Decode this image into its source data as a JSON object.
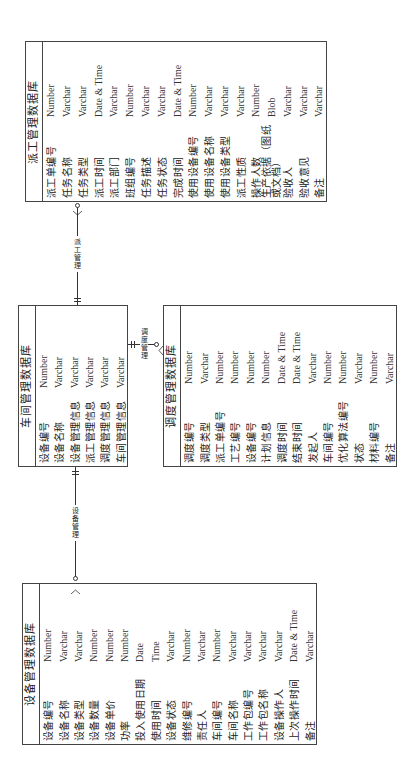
{
  "diagram": {
    "tables": {
      "dispatch": {
        "title": "派工管理数据库",
        "fields": [
          {
            "name": "派工单编号",
            "type": "Number"
          },
          {
            "name": "任务名称",
            "type": "Varchar"
          },
          {
            "name": "任务类型",
            "type": "Varchar"
          },
          {
            "name": "派工时间",
            "type": "Date & Time"
          },
          {
            "name": "派工部门",
            "type": "Varchar"
          },
          {
            "name": "班组编号",
            "type": "Number"
          },
          {
            "name": "任务描述",
            "type": "Varchar"
          },
          {
            "name": "任务状态",
            "type": "Varchar"
          },
          {
            "name": "完成时间",
            "type": "Date & Time"
          },
          {
            "name": "使用设备编号",
            "type": "Number"
          },
          {
            "name": "使用设备名称",
            "type": "Varchar"
          },
          {
            "name": "使用设备类型",
            "type": "Varchar"
          },
          {
            "name": "派工性质",
            "type": "Varchar"
          },
          {
            "name": "操作人数",
            "type": "Number"
          },
          {
            "name": "生产依据（图纸或文档）",
            "type": "Blob"
          },
          {
            "name": "验收人",
            "type": "Varchar"
          },
          {
            "name": "验收意见",
            "type": "Varchar"
          },
          {
            "name": "备注",
            "type": "Varchar"
          }
        ]
      },
      "workshop": {
        "title": "车间管理数据库",
        "fields": [
          {
            "name": "设备编号",
            "type": "Number"
          },
          {
            "name": "设备名称",
            "type": "Varchar"
          },
          {
            "name": "设备管理信息",
            "type": "Varchar"
          },
          {
            "name": "派工管理信息",
            "type": "Varchar"
          },
          {
            "name": "调度管理信息",
            "type": "Varchar"
          },
          {
            "name": "车间管理信息",
            "type": "Varchar"
          }
        ]
      },
      "scheduling": {
        "title": "调度管理数据库",
        "fields": [
          {
            "name": "调度编号",
            "type": "Number"
          },
          {
            "name": "调度类型",
            "type": "Varchar"
          },
          {
            "name": "派工单编号",
            "type": "Number"
          },
          {
            "name": "工艺编号",
            "type": "Number"
          },
          {
            "name": "设备编号",
            "type": "Number"
          },
          {
            "name": "计划信息",
            "type": "Number"
          },
          {
            "name": "调度时间",
            "type": "Date & Time"
          },
          {
            "name": "结束时间",
            "type": "Date & Time"
          },
          {
            "name": "发起人",
            "type": "Varchar"
          },
          {
            "name": "车间编号",
            "type": "Number"
          },
          {
            "name": "优化算法编号",
            "type": "Number"
          },
          {
            "name": "状态",
            "type": "Varchar"
          },
          {
            "name": "材料编号",
            "type": "Number"
          },
          {
            "name": "备注",
            "type": "Varchar"
          }
        ]
      },
      "equipment": {
        "title": "设备管理数据库",
        "fields": [
          {
            "name": "设备编号",
            "type": "Number"
          },
          {
            "name": "设备名称",
            "type": "Varchar"
          },
          {
            "name": "设备类型",
            "type": "Varchar"
          },
          {
            "name": "设备数量",
            "type": "Number"
          },
          {
            "name": "设备单价",
            "type": "Number"
          },
          {
            "name": "功率",
            "type": "Number"
          },
          {
            "name": "投入使用日期",
            "type": "Date"
          },
          {
            "name": "使用时间",
            "type": "Time"
          },
          {
            "name": "设备状态",
            "type": "Varchar"
          },
          {
            "name": "维修编号",
            "type": "Number"
          },
          {
            "name": "责任人",
            "type": "Varchar"
          },
          {
            "name": "车间编号",
            "type": "Number"
          },
          {
            "name": "车间名称",
            "type": "Varchar"
          },
          {
            "name": "工作包编号",
            "type": "Varchar"
          },
          {
            "name": "工作包名称",
            "type": "Varchar"
          },
          {
            "name": "设备操作人",
            "type": "Varchar"
          },
          {
            "name": "上次操作时间",
            "type": "Date & Time"
          },
          {
            "name": "备注",
            "type": "Varchar"
          }
        ]
      }
    },
    "relations": {
      "dispatch_mgmt": "派工管理",
      "scheduling_mgmt": "调度管理",
      "equipment_mgmt": "设备管理"
    }
  }
}
